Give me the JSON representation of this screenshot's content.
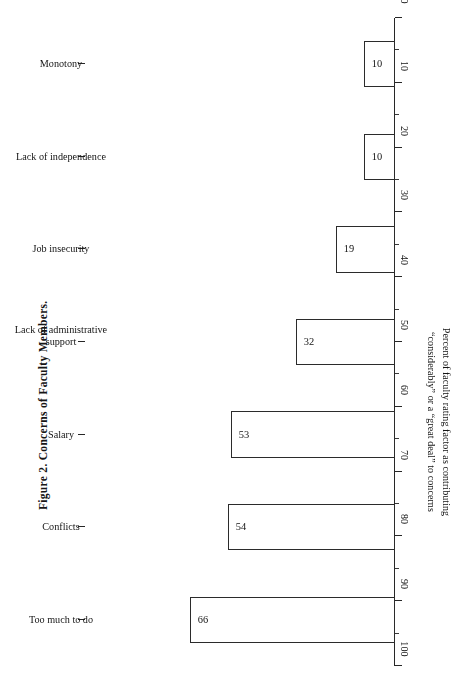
{
  "figure": {
    "caption": "Figure 2. Concerns of Faculty Members."
  },
  "chart_data": {
    "type": "bar",
    "orientation": "horizontal",
    "title": "Figure 2. Concerns of Faculty Members.",
    "categories": [
      "Monotony",
      "Lack of independence",
      "Job insecurity",
      "Lack of administrative support",
      "Salary",
      "Conflicts",
      "Too much to do"
    ],
    "values": [
      10,
      10,
      19,
      32,
      53,
      54,
      66
    ],
    "xlabel": "",
    "ylabel": "Percent of faculty rating factor as contributing “considerably” or a “great deal” to concerns",
    "ylabel_line1": "Percent of faculty rating factor as contributing",
    "ylabel_line2": "“considerably” or a “great deal” to concerns",
    "ylim": [
      0,
      100
    ],
    "ytick_labels": [
      "0",
      "10",
      "20",
      "30",
      "40",
      "50",
      "60",
      "70",
      "80",
      "90",
      "100"
    ],
    "ytick_values": [
      0,
      10,
      20,
      30,
      40,
      50,
      60,
      70,
      80,
      90,
      100
    ],
    "minor_tick_step": 5,
    "grid": false,
    "legend": false,
    "bar_fill_color": "#ffffff",
    "bar_edge_color": "#2b2b2b",
    "axis_color": "#272727",
    "text_color": "#141414",
    "rotation_deg": 180,
    "caption_rotation_deg": 90
  }
}
